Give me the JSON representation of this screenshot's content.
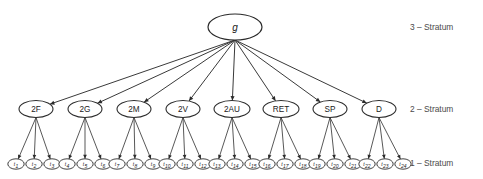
{
  "figure": {
    "background_color": "#ffffff",
    "line_color": "#3a3a3a",
    "text_color": "#1a1a1a",
    "stratum_label_color": "#4a4a4a"
  },
  "stratum_labels": [
    {
      "id": "stratum-3",
      "text": "3 – Stratum",
      "x": 410,
      "y": 27
    },
    {
      "id": "stratum-2",
      "text": "2 – Stratum",
      "x": 410,
      "y": 109
    },
    {
      "id": "stratum-1",
      "text": "1 – Stratum",
      "x": 410,
      "y": 163
    }
  ],
  "root": {
    "id": "g",
    "label": "g",
    "cx": 235,
    "cy": 27,
    "rx": 27,
    "ry": 13
  },
  "stratum2_nodes": [
    {
      "id": "2F",
      "label": "2F",
      "cx": 36,
      "cy": 109,
      "rx": 17,
      "ry": 8.5
    },
    {
      "id": "2G",
      "label": "2G",
      "cx": 85,
      "cy": 109,
      "rx": 17,
      "ry": 8.5
    },
    {
      "id": "2M",
      "label": "2M",
      "cx": 134,
      "cy": 109,
      "rx": 17,
      "ry": 8.5
    },
    {
      "id": "2V",
      "label": "2V",
      "cx": 183,
      "cy": 109,
      "rx": 17,
      "ry": 8.5
    },
    {
      "id": "2AU",
      "label": "2AU",
      "cx": 232,
      "cy": 109,
      "rx": 18,
      "ry": 8.5
    },
    {
      "id": "RET",
      "label": "RET",
      "cx": 281,
      "cy": 109,
      "rx": 18,
      "ry": 8.5
    },
    {
      "id": "SP",
      "label": "SP",
      "cx": 330,
      "cy": 109,
      "rx": 17,
      "ry": 8.5
    },
    {
      "id": "D",
      "label": "D",
      "cx": 379,
      "cy": 109,
      "rx": 17,
      "ry": 8.5
    }
  ],
  "stratum1_nodes": [
    {
      "id": "t1",
      "label": "t",
      "sub": "1",
      "cx": 16,
      "cy": 164,
      "rx": 8.2,
      "ry": 5.2,
      "parent": "2F"
    },
    {
      "id": "t2",
      "label": "t",
      "sub": "2",
      "cx": 34,
      "cy": 164,
      "rx": 8.2,
      "ry": 5.2,
      "parent": "2F"
    },
    {
      "id": "t3",
      "label": "t",
      "sub": "3",
      "cx": 52,
      "cy": 164,
      "rx": 8.2,
      "ry": 5.2,
      "parent": "2F"
    },
    {
      "id": "t4",
      "label": "t",
      "sub": "4",
      "cx": 67,
      "cy": 164,
      "rx": 8.2,
      "ry": 5.2,
      "parent": "2G"
    },
    {
      "id": "t5",
      "label": "t",
      "sub": "5",
      "cx": 85,
      "cy": 164,
      "rx": 8.2,
      "ry": 5.2,
      "parent": "2G"
    },
    {
      "id": "t6",
      "label": "t",
      "sub": "6",
      "cx": 103,
      "cy": 164,
      "rx": 8.2,
      "ry": 5.2,
      "parent": "2G"
    },
    {
      "id": "t7",
      "label": "t",
      "sub": "7",
      "cx": 117,
      "cy": 164,
      "rx": 8.2,
      "ry": 5.2,
      "parent": "2M"
    },
    {
      "id": "t8",
      "label": "t",
      "sub": "8",
      "cx": 135,
      "cy": 164,
      "rx": 8.2,
      "ry": 5.2,
      "parent": "2M"
    },
    {
      "id": "t9",
      "label": "t",
      "sub": "9",
      "cx": 153,
      "cy": 164,
      "rx": 8.2,
      "ry": 5.2,
      "parent": "2M"
    },
    {
      "id": "t10",
      "label": "t",
      "sub": "10",
      "cx": 167,
      "cy": 164,
      "rx": 8.2,
      "ry": 5.2,
      "parent": "2V"
    },
    {
      "id": "t11",
      "label": "t",
      "sub": "11",
      "cx": 185,
      "cy": 164,
      "rx": 8.2,
      "ry": 5.2,
      "parent": "2V"
    },
    {
      "id": "t12",
      "label": "t",
      "sub": "12",
      "cx": 203,
      "cy": 164,
      "rx": 8.2,
      "ry": 5.2,
      "parent": "2V"
    },
    {
      "id": "t13",
      "label": "t",
      "sub": "13",
      "cx": 217,
      "cy": 164,
      "rx": 8.2,
      "ry": 5.2,
      "parent": "2AU"
    },
    {
      "id": "t14",
      "label": "t",
      "sub": "14",
      "cx": 235,
      "cy": 164,
      "rx": 8.2,
      "ry": 5.2,
      "parent": "2AU"
    },
    {
      "id": "t15",
      "label": "t",
      "sub": "15",
      "cx": 253,
      "cy": 164,
      "rx": 8.2,
      "ry": 5.2,
      "parent": "2AU"
    },
    {
      "id": "t16",
      "label": "t",
      "sub": "16",
      "cx": 267,
      "cy": 164,
      "rx": 8.2,
      "ry": 5.2,
      "parent": "RET"
    },
    {
      "id": "t17",
      "label": "t",
      "sub": "17",
      "cx": 285,
      "cy": 164,
      "rx": 8.2,
      "ry": 5.2,
      "parent": "RET"
    },
    {
      "id": "t18",
      "label": "t",
      "sub": "18",
      "cx": 303,
      "cy": 164,
      "rx": 8.2,
      "ry": 5.2,
      "parent": "RET"
    },
    {
      "id": "t19",
      "label": "t",
      "sub": "19",
      "cx": 317,
      "cy": 164,
      "rx": 8.2,
      "ry": 5.2,
      "parent": "SP"
    },
    {
      "id": "t20",
      "label": "t",
      "sub": "20",
      "cx": 335,
      "cy": 164,
      "rx": 8.2,
      "ry": 5.2,
      "parent": "SP"
    },
    {
      "id": "t21",
      "label": "t",
      "sub": "21",
      "cx": 353,
      "cy": 164,
      "rx": 8.2,
      "ry": 5.2,
      "parent": "SP"
    },
    {
      "id": "t22",
      "label": "t",
      "sub": "22",
      "cx": 367,
      "cy": 164,
      "rx": 8.2,
      "ry": 5.2,
      "parent": "D"
    },
    {
      "id": "t23",
      "label": "t",
      "sub": "23",
      "cx": 385,
      "cy": 164,
      "rx": 8.2,
      "ry": 5.2,
      "parent": "D"
    },
    {
      "id": "t24",
      "label": "t",
      "sub": "24",
      "cx": 403,
      "cy": 164,
      "rx": 8.2,
      "ry": 5.2,
      "parent": "D"
    }
  ]
}
